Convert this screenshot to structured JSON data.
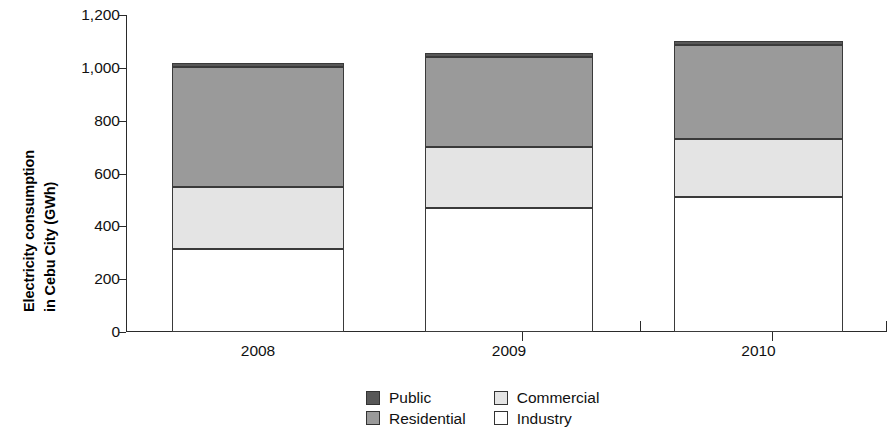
{
  "chart_data": {
    "type": "bar",
    "subtype": "stacked-bar",
    "title": "",
    "xlabel": "",
    "ylabel": "Electricity consumption in Cebu City (GWh)",
    "categories": [
      "2008",
      "2009",
      "2010"
    ],
    "series": [
      {
        "name": "Industry",
        "values": [
          315,
          470,
          510
        ],
        "color": "#ffffff"
      },
      {
        "name": "Commercial",
        "values": [
          235,
          230,
          220
        ],
        "color": "#e4e4e4"
      },
      {
        "name": "Residential",
        "values": [
          455,
          340,
          355
        ],
        "color": "#9a9a9a"
      },
      {
        "name": "Public",
        "values": [
          15,
          15,
          15
        ],
        "color": "#585858"
      }
    ],
    "stack_order_bottom_to_top": [
      "Industry",
      "Commercial",
      "Residential",
      "Public"
    ],
    "cumulative_tops": {
      "2008": {
        "Industry": 315,
        "Commercial": 550,
        "Residential": 1005,
        "Public": 1020
      },
      "2009": {
        "Industry": 470,
        "Commercial": 700,
        "Residential": 1040,
        "Public": 1055
      },
      "2010": {
        "Industry": 510,
        "Commercial": 730,
        "Residential": 1085,
        "Public": 1100
      }
    },
    "totals": [
      1020,
      1055,
      1100
    ],
    "ylim": [
      0,
      1200
    ],
    "ytick_values": [
      0,
      200,
      400,
      600,
      800,
      1000,
      1200
    ],
    "ytick_labels": [
      "0",
      "200",
      "400",
      "600",
      "800",
      "1,000",
      "1,200"
    ],
    "grid": false,
    "legend_position": "bottom-center",
    "legend_entries": [
      "Public",
      "Commercial",
      "Residential",
      "Industry"
    ]
  },
  "axis": {
    "y_title_line1": "Electricity consumption",
    "y_title_line2": "in Cebu City (GWh)"
  },
  "legend": {
    "items": [
      {
        "label": "Public",
        "color": "#585858"
      },
      {
        "label": "Commercial",
        "color": "#e4e4e4"
      },
      {
        "label": "Residential",
        "color": "#9a9a9a"
      },
      {
        "label": "Industry",
        "color": "#ffffff"
      }
    ]
  }
}
